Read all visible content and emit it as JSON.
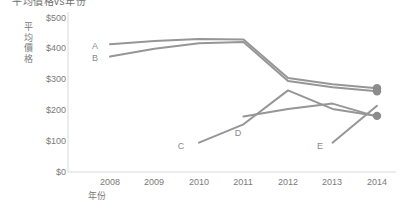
{
  "chart_data": {
    "type": "line",
    "title": "平均價格vs年份",
    "xlabel": "年份",
    "ylabel": "平均價格",
    "categories": [
      2008,
      2009,
      2010,
      2011,
      2012,
      2013,
      2014
    ],
    "x_tick_labels": [
      "2008",
      "2009",
      "2010",
      "2011",
      "2012",
      "2013",
      "2014"
    ],
    "y_tick_labels": [
      "$500",
      "$400",
      "$300",
      "$200",
      "$100",
      "$0"
    ],
    "y_tick_values": [
      500,
      400,
      300,
      200,
      100,
      0
    ],
    "ylim": [
      0,
      500
    ],
    "xlim": [
      2008,
      2014
    ],
    "grid": false,
    "legend": "inline-labels",
    "line_color": "#969696",
    "axis_color": "#d9d9d9",
    "text_color": "#7a7a7a",
    "marker": "circle-endpoint",
    "series": [
      {
        "name": "A",
        "label": "A",
        "x": [
          2008,
          2009,
          2010,
          2011,
          2012,
          2013,
          2014
        ],
        "values": [
          415,
          425,
          432,
          430,
          305,
          285,
          272
        ]
      },
      {
        "name": "B",
        "label": "B",
        "x": [
          2008,
          2009,
          2010,
          2011,
          2012,
          2013,
          2014
        ],
        "values": [
          375,
          400,
          418,
          422,
          295,
          275,
          262
        ]
      },
      {
        "name": "C",
        "label": "C",
        "x": [
          2010,
          2011,
          2012,
          2013,
          2014
        ],
        "values": [
          95,
          155,
          265,
          205,
          182
        ]
      },
      {
        "name": "D",
        "label": "D",
        "x": [
          2011,
          2012,
          2013,
          2014
        ],
        "values": [
          180,
          205,
          222,
          180
        ]
      },
      {
        "name": "E",
        "label": "E",
        "x": [
          2013,
          2014
        ],
        "values": [
          95,
          215
        ]
      }
    ],
    "endpoints": [
      {
        "series": "A",
        "value": 272
      },
      {
        "series": "B",
        "value": 262
      },
      {
        "series": "C",
        "value": 182
      }
    ]
  }
}
